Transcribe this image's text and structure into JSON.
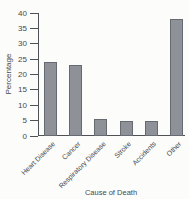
{
  "chart_data": {
    "type": "bar",
    "categories": [
      "Heart Disease",
      "Cancer",
      "Respiratory Disease",
      "Stroke",
      "Accidents",
      "Other"
    ],
    "values": [
      24,
      23,
      5.5,
      5,
      5,
      38
    ],
    "title": "",
    "xlabel": "Cause of Death",
    "ylabel": "Percentage",
    "ylim": [
      0,
      40
    ],
    "ytick_step": 5,
    "grid": false,
    "legend": "none",
    "colors": {
      "bar_fill": "#8e9298",
      "bar_border": "#666b71",
      "axis": "#4e5257",
      "text": "#45494f",
      "background": "#fcfcfa"
    }
  }
}
